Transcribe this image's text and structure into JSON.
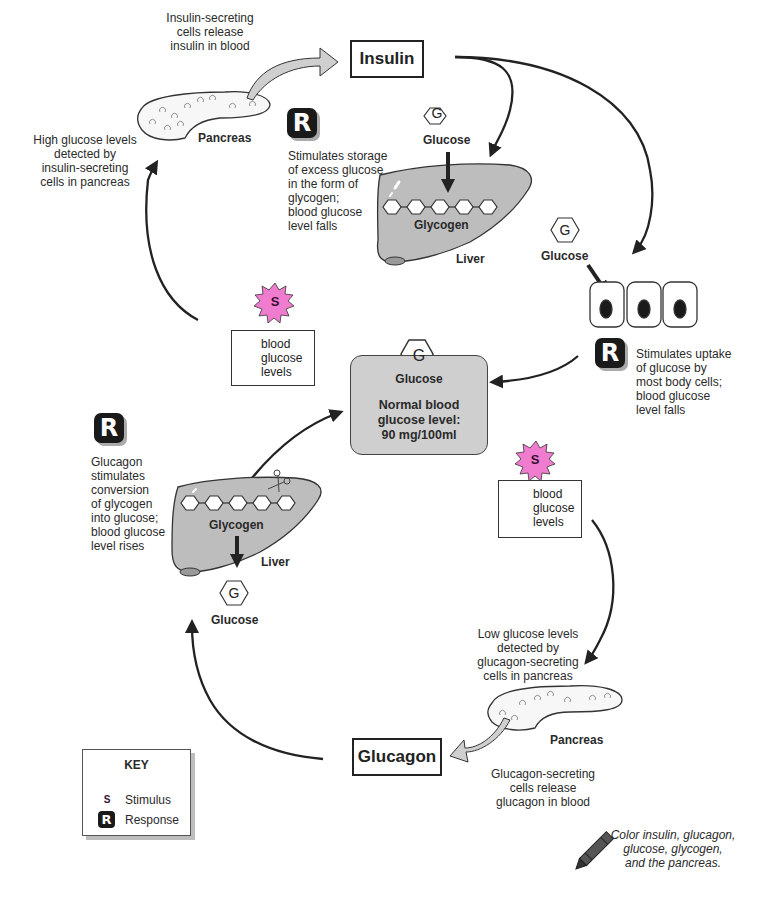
{
  "hormones": {
    "insulin": "Insulin",
    "glucagon": "Glucagon"
  },
  "top_cycle": {
    "insulin_release": [
      "Insulin-secreting",
      "cells release",
      "insulin in blood"
    ],
    "pancreas_label": "Pancreas",
    "high_glucose_detected": [
      "High glucose levels",
      "detected by",
      "insulin-secreting",
      "cells in pancreas"
    ],
    "liver_response": {
      "badge": "R",
      "text": [
        "Stimulates storage",
        "of excess glucose",
        "in the form of",
        "glycogen;",
        "blood glucose",
        "level falls"
      ]
    },
    "liver_glucose_label": "Glucose",
    "liver_glucose_symbol": "G",
    "liver_glycogen_label": "Glycogen",
    "liver_label": "Liver",
    "cells_glucose_label": "Glucose",
    "cells_glucose_symbol": "G",
    "cells_response": {
      "badge": "R",
      "text": [
        "Stimulates uptake",
        "of glucose by",
        "most body cells;",
        "blood glucose",
        "level falls"
      ]
    },
    "stimulus": {
      "badge": "S",
      "direction": "up",
      "text": [
        "blood",
        "glucose",
        "levels"
      ]
    }
  },
  "center": {
    "symbol": "G",
    "label": "Glucose",
    "normal_level": [
      "Normal blood",
      "glucose level:",
      "90 mg/100ml"
    ]
  },
  "bottom_cycle": {
    "stimulus": {
      "badge": "S",
      "direction": "down",
      "text": [
        "blood",
        "glucose",
        "levels"
      ]
    },
    "low_glucose_detected": [
      "Low glucose levels",
      "detected by",
      "glucagon-secreting",
      "cells in pancreas"
    ],
    "pancreas_label": "Pancreas",
    "glucagon_release": [
      "Glucagon-secreting",
      "cells release",
      "glucagon in blood"
    ],
    "liver_response": {
      "badge": "R",
      "text": [
        "Glucagon",
        "stimulates",
        "conversion",
        "of glycogen",
        "into glucose;",
        "blood glucose",
        "level rises"
      ]
    },
    "liver_glycogen_label": "Glycogen",
    "liver_label": "Liver",
    "liver_glucose_symbol": "G",
    "liver_glucose_label": "Glucose"
  },
  "key": {
    "title": "KEY",
    "items": [
      {
        "badge": "S",
        "label": "Stimulus",
        "icon": "stimulus-starburst-icon"
      },
      {
        "badge": "R",
        "label": "Response",
        "icon": "response-badge-icon"
      }
    ]
  },
  "instruction": [
    "Color insulin, glucagon,",
    "glucose, glycogen,",
    "and the pancreas."
  ],
  "colors": {
    "stimulus_pink": "#f07ccf",
    "liver_gray": "#bdbdbd",
    "center_box_gray": "#cfcfcf",
    "arrow_dark": "#222222",
    "release_arrow_gray": "#c8c8c8"
  }
}
